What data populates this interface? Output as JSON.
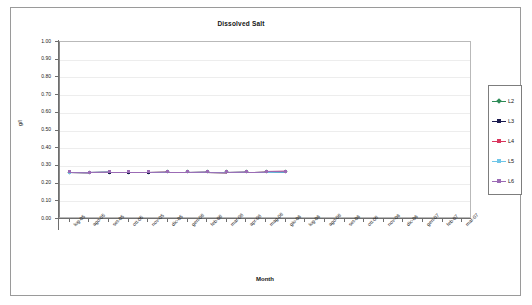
{
  "chart_data": {
    "type": "line",
    "title": "Dissolved Salt",
    "xlabel": "Month",
    "ylabel": "g/l",
    "ylim": [
      0.0,
      1.0
    ],
    "ytick_step": 0.1,
    "ytick_labels": [
      "1.00",
      "0.90",
      "0.80",
      "0.70",
      "0.60",
      "0.50",
      "0.40",
      "0.30",
      "0.20",
      "0.10",
      "0.00"
    ],
    "grid": true,
    "legend_position": "right",
    "categories": [
      "lug-05",
      "ago-05",
      "set-05",
      "ott-05",
      "nov-05",
      "dic-05",
      "gen-06",
      "feb-06",
      "mar-06",
      "apr-06",
      "mag-06",
      "giu-06",
      "lug-06",
      "ago-06",
      "set-06",
      "ott-06",
      "nov-06",
      "dic-06",
      "gen-07",
      "feb-07",
      "mar-07"
    ],
    "series": [
      {
        "name": "L2",
        "color": "#2e8b57",
        "marker": "diamond",
        "values": [
          0.265,
          0.263,
          0.265,
          0.265,
          0.265,
          0.266,
          0.266,
          0.267,
          0.266,
          0.267,
          0.268,
          0.27,
          null,
          null,
          null,
          null,
          null,
          null,
          null,
          null,
          null
        ]
      },
      {
        "name": "L3",
        "color": "#1b1b4f",
        "marker": "square",
        "values": [
          0.265,
          0.263,
          0.265,
          0.265,
          0.265,
          0.266,
          0.266,
          0.267,
          0.266,
          0.267,
          0.268,
          0.27,
          null,
          null,
          null,
          null,
          null,
          null,
          null,
          null,
          null
        ]
      },
      {
        "name": "L4",
        "color": "#d9365e",
        "marker": "square",
        "values": [
          0.266,
          0.264,
          0.266,
          0.266,
          0.266,
          0.267,
          0.267,
          0.268,
          0.267,
          0.268,
          0.269,
          0.271,
          null,
          null,
          null,
          null,
          null,
          null,
          null,
          null,
          null
        ]
      },
      {
        "name": "L5",
        "color": "#6fc6e8",
        "marker": "square",
        "values": [
          0.265,
          0.263,
          0.266,
          0.266,
          0.266,
          0.266,
          0.266,
          0.267,
          0.267,
          0.268,
          0.268,
          0.27,
          null,
          null,
          null,
          null,
          null,
          null,
          null,
          null,
          null
        ]
      },
      {
        "name": "L6",
        "color": "#9b6bb5",
        "marker": "square",
        "values": [
          0.266,
          0.264,
          0.266,
          0.266,
          0.266,
          0.267,
          0.267,
          0.268,
          0.267,
          0.268,
          0.269,
          0.271,
          null,
          null,
          null,
          null,
          null,
          null,
          null,
          null,
          null
        ]
      }
    ]
  },
  "legend": {
    "items": [
      {
        "label": "L2"
      },
      {
        "label": "L3"
      },
      {
        "label": "L4"
      },
      {
        "label": "L5"
      },
      {
        "label": "L6"
      }
    ]
  }
}
